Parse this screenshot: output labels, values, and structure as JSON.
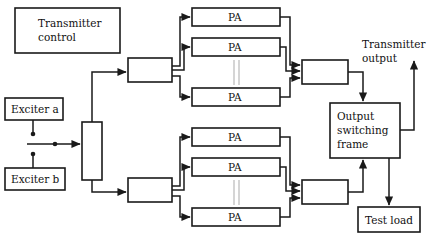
{
  "diagram": {
    "colors": {
      "stroke": "#1a1a1a",
      "fill": "#ffffff",
      "faint": "#b9b9b9",
      "background": "#ffffff"
    },
    "blocks": {
      "transmitter_control": "Transmitter\ncontrol",
      "transmitter_control_line1": "Transmitter",
      "transmitter_control_line2": "control",
      "exciter_a": "Exciter a",
      "exciter_b": "Exciter b",
      "output_switching_frame_line1": "Output",
      "output_switching_frame_line2": "switching",
      "output_switching_frame_line3": "frame",
      "test_load": "Test load",
      "pa": "PA",
      "splitter": "",
      "driver_upper": "",
      "driver_lower": "",
      "combiner_upper": "",
      "combiner_lower": ""
    },
    "pa_blocks": {
      "upper": [
        "PA",
        "PA",
        "PA"
      ],
      "lower": [
        "PA",
        "PA",
        "PA"
      ]
    },
    "free_labels": {
      "transmitter_output_line1": "Transmitter",
      "transmitter_output_line2": "output"
    }
  }
}
